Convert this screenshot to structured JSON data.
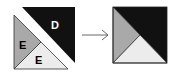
{
  "diagram": {
    "left_figure": {
      "pieces": [
        {
          "id": "D",
          "label": "D",
          "shape": "triangle",
          "color": "#111111",
          "label_color": "#ffffff"
        },
        {
          "id": "E1",
          "label": "E",
          "shape": "triangle",
          "color": "#a9a9a9",
          "label_color": "#000000"
        },
        {
          "id": "E2",
          "label": "E",
          "shape": "triangle",
          "color": "#ececec",
          "label_color": "#000000"
        }
      ]
    },
    "arrow": {
      "direction": "right",
      "color": "#555555"
    },
    "right_figure": {
      "pieces": [
        {
          "id": "black",
          "shape": "triangle",
          "color": "#111111"
        },
        {
          "id": "gray",
          "shape": "triangle",
          "color": "#a9a9a9"
        },
        {
          "id": "light",
          "shape": "triangle",
          "color": "#ececec"
        }
      ]
    }
  }
}
